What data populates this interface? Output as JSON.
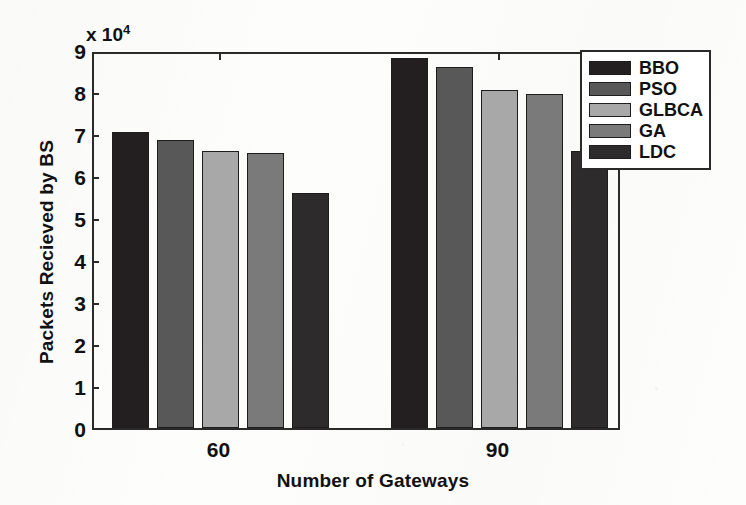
{
  "chart_data": {
    "type": "bar",
    "title": "",
    "xlabel": "Number of Gateways",
    "ylabel": "Packets Recieved by BS",
    "y_multiplier_text": "x 10",
    "y_multiplier_exp": "4",
    "categories": [
      "60",
      "90"
    ],
    "ylim": [
      0,
      9
    ],
    "yticks": [
      0,
      1,
      2,
      3,
      4,
      5,
      6,
      7,
      8,
      9
    ],
    "ytick_labels": [
      "0",
      "1",
      "2",
      "3",
      "4",
      "5",
      "6",
      "7",
      "8",
      "9"
    ],
    "grid": false,
    "legend_position": "top-right",
    "series": [
      {
        "name": "BBO",
        "color": "#231f20",
        "values": [
          7.05,
          8.8
        ]
      },
      {
        "name": "PSO",
        "color": "#585858",
        "values": [
          6.85,
          8.6
        ]
      },
      {
        "name": "GLBCA",
        "color": "#a8a8a8",
        "values": [
          6.6,
          8.05
        ]
      },
      {
        "name": "GA",
        "color": "#7a7a7a",
        "values": [
          6.55,
          7.95
        ]
      },
      {
        "name": "LDC",
        "color": "#2e2b2c",
        "values": [
          5.6,
          6.6
        ]
      }
    ]
  },
  "axes": {
    "y_title": "Packets Recieved by BS",
    "x_title": "Number of Gateways",
    "multiplier": "x 10",
    "multiplier_exponent": "4"
  },
  "legend": {
    "items": [
      {
        "label": "BBO",
        "color": "#231f20"
      },
      {
        "label": "PSO",
        "color": "#585858"
      },
      {
        "label": "GLBCA",
        "color": "#a8a8a8"
      },
      {
        "label": "GA",
        "color": "#7a7a7a"
      },
      {
        "label": "LDC",
        "color": "#2e2b2c"
      }
    ]
  }
}
